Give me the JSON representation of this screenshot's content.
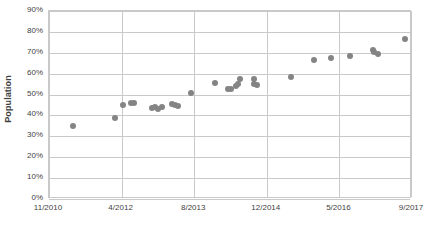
{
  "chart_data": {
    "type": "scatter",
    "title": "",
    "xlabel": "",
    "ylabel": "Population",
    "grid": true,
    "legend": false,
    "series_color": "#848484",
    "ylim": [
      0,
      90
    ],
    "ytick_labels": [
      "90%",
      "80%",
      "70%",
      "60%",
      "50%",
      "40%",
      "30%",
      "20%",
      "10%",
      "0%"
    ],
    "ytick_values": [
      90,
      80,
      70,
      60,
      50,
      40,
      30,
      20,
      10,
      0
    ],
    "xtick_labels": [
      "11/2010",
      "4/2012",
      "8/2013",
      "12/2014",
      "5/2016",
      "9/2017"
    ],
    "xtick_positions": [
      0,
      1,
      2,
      3,
      4,
      5
    ],
    "xlim": [
      0,
      5
    ],
    "points": [
      {
        "x": 0.33,
        "y": 35.0
      },
      {
        "x": 0.91,
        "y": 39.0
      },
      {
        "x": 1.02,
        "y": 44.8
      },
      {
        "x": 1.13,
        "y": 46.0
      },
      {
        "x": 1.17,
        "y": 45.8
      },
      {
        "x": 1.42,
        "y": 43.6
      },
      {
        "x": 1.46,
        "y": 43.9
      },
      {
        "x": 1.5,
        "y": 43.2
      },
      {
        "x": 1.56,
        "y": 44.2
      },
      {
        "x": 1.69,
        "y": 45.6
      },
      {
        "x": 1.74,
        "y": 44.8
      },
      {
        "x": 1.77,
        "y": 44.6
      },
      {
        "x": 1.95,
        "y": 50.6
      },
      {
        "x": 2.29,
        "y": 55.6
      },
      {
        "x": 2.47,
        "y": 52.6
      },
      {
        "x": 2.51,
        "y": 52.6
      },
      {
        "x": 2.58,
        "y": 54.0
      },
      {
        "x": 2.61,
        "y": 55.0
      },
      {
        "x": 2.63,
        "y": 57.6
      },
      {
        "x": 2.82,
        "y": 57.4
      },
      {
        "x": 2.83,
        "y": 55.0
      },
      {
        "x": 2.86,
        "y": 54.6
      },
      {
        "x": 3.33,
        "y": 58.5
      },
      {
        "x": 3.65,
        "y": 66.4
      },
      {
        "x": 3.88,
        "y": 67.4
      },
      {
        "x": 4.14,
        "y": 68.4
      },
      {
        "x": 4.46,
        "y": 71.2
      },
      {
        "x": 4.48,
        "y": 70.5
      },
      {
        "x": 4.53,
        "y": 69.4
      },
      {
        "x": 4.91,
        "y": 76.4
      }
    ]
  }
}
